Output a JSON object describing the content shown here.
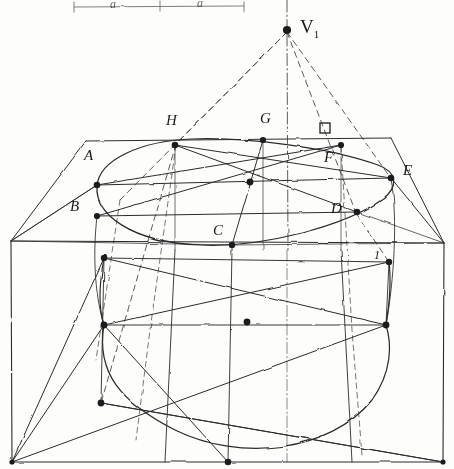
{
  "figure": {
    "ink_color": "#2b2b2b",
    "paper_color": "#fdfdfc",
    "width": 454,
    "height": 469
  },
  "vanishing_point": {
    "label": "V",
    "subscript": "1",
    "x": 287,
    "y": 30
  },
  "scale_bar": {
    "segment_label_left": "a",
    "segment_label_right": "a",
    "y": 6,
    "x_start": 74,
    "x_mid": 160,
    "x_end": 244
  },
  "ellipse_points": [
    {
      "label": "A",
      "px": 97,
      "py": 185,
      "lx": 84,
      "ly": 155
    },
    {
      "label": "B",
      "px": 97,
      "py": 216,
      "lx": 70,
      "ly": 206
    },
    {
      "label": "C",
      "px": 232,
      "py": 245,
      "lx": 213,
      "ly": 230
    },
    {
      "label": "D",
      "px": 357,
      "py": 212,
      "lx": 331,
      "ly": 208
    },
    {
      "label": "E",
      "px": 391,
      "py": 178,
      "lx": 403,
      "ly": 170
    },
    {
      "label": "F",
      "px": 341,
      "py": 145,
      "lx": 324,
      "ly": 157
    },
    {
      "label": "G",
      "px": 263,
      "py": 140,
      "lx": 260,
      "ly": 118
    },
    {
      "label": "H",
      "px": 175,
      "py": 145,
      "lx": 166,
      "ly": 120
    }
  ],
  "square_marker": {
    "name": "right-angle-square",
    "x": 325,
    "y": 128,
    "size": 10
  },
  "lower_marker": {
    "label": "1",
    "x": 374,
    "y": 256
  },
  "center_point": {
    "x": 250,
    "y": 182
  },
  "lower_ellipse_points": [
    {
      "x": 104,
      "y": 325
    },
    {
      "x": 101,
      "y": 403
    },
    {
      "x": 386,
      "y": 325
    },
    {
      "x": 389,
      "y": 262
    },
    {
      "x": 247,
      "y": 322
    },
    {
      "x": 228,
      "y": 462
    }
  ],
  "frame": {
    "left_x": 11,
    "right_x": 444,
    "top_y": 241,
    "bottom_y": 462
  },
  "notes": {
    "axis_style": "dash-dot vertical centre line",
    "construction_style": "dashed sight lines to vanishing point"
  }
}
